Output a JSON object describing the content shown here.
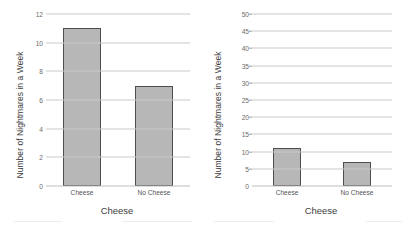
{
  "chart_data": [
    {
      "type": "bar",
      "panel": "left",
      "title": "",
      "categories": [
        "Cheese",
        "No Cheese"
      ],
      "values": [
        11,
        7
      ],
      "xlabel": "Cheese",
      "ylabel": "Number of Nightmares in a Week",
      "ylim": [
        0,
        12
      ],
      "yticks": [
        0,
        2,
        4,
        6,
        8,
        10,
        12
      ],
      "ytick_labels": [
        "0",
        "2",
        "4",
        "6",
        "8",
        "10",
        "12"
      ],
      "grid": true,
      "legend": "none",
      "bar_fill": "#b7b7b7",
      "bar_border": "#4e4e4e"
    },
    {
      "type": "bar",
      "panel": "right",
      "title": "",
      "categories": [
        "Cheese",
        "No Cheese"
      ],
      "values": [
        11,
        7
      ],
      "xlabel": "Cheese",
      "ylabel": "Number of Nightmares in a Week",
      "ylim": [
        0,
        50
      ],
      "yticks": [
        0,
        5,
        10,
        15,
        20,
        25,
        30,
        35,
        40,
        45,
        50
      ],
      "ytick_labels": [
        "0",
        "5",
        "10",
        "15",
        "20",
        "25",
        "30",
        "35",
        "40",
        "45",
        "50"
      ],
      "grid": true,
      "legend": "none",
      "bar_fill": "#b7b7b7",
      "bar_border": "#4e4e4e"
    }
  ],
  "left_chart": {
    "ylabel": "Number of Nightmares in a Week",
    "xlabel": "Cheese",
    "ytick_labels": [
      "12",
      "10",
      "8",
      "6",
      "4",
      "2",
      "0"
    ],
    "bar_labels": [
      "Cheese",
      "No Cheese"
    ]
  },
  "right_chart": {
    "ylabel": "Number of Nightmares in a Week",
    "xlabel": "Cheese",
    "ytick_labels": [
      "50",
      "45",
      "40",
      "35",
      "30",
      "25",
      "20",
      "15",
      "10",
      "5",
      "0"
    ],
    "bar_labels": [
      "Cheese",
      "No Cheese"
    ]
  }
}
